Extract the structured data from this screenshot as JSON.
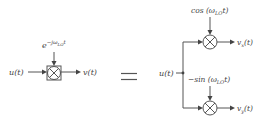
{
  "diagram": {
    "type": "block-diagram",
    "colors": {
      "stroke": "#555555",
      "text": "#444444",
      "background": "#ffffff"
    },
    "left": {
      "input_label": "u(t)",
      "output_label": "v(t)",
      "lo_base": "e",
      "lo_exponent": "−jω",
      "lo_exponent_sub": "LO",
      "lo_exponent_tail": "t",
      "mixer_icon": "multiplier-box-icon"
    },
    "equals_sign": "=",
    "right": {
      "input_label": "u(t)",
      "upper": {
        "lo_prefix": "cos (ω",
        "lo_sub": "LO",
        "lo_suffix": "t)",
        "output_main": "v",
        "output_sub": "x",
        "output_tail": "(t)",
        "mixer_icon": "multiplier-circle-icon"
      },
      "lower": {
        "lo_prefix": "−sin (ω",
        "lo_sub": "LO",
        "lo_suffix": "t)",
        "output_main": "v",
        "output_sub": "y",
        "output_tail": "(t)",
        "mixer_icon": "multiplier-circle-icon"
      }
    }
  }
}
